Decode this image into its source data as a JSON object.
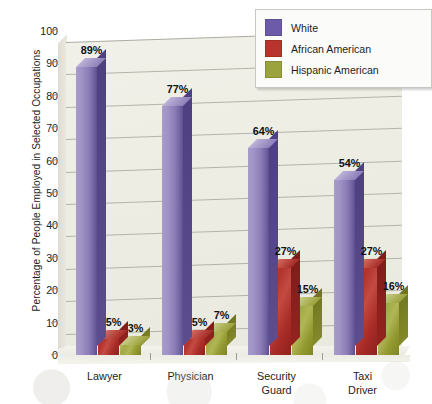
{
  "chart_data": {
    "type": "bar",
    "title": "",
    "subtitle": "",
    "xlabel": "",
    "ylabel": "Percentage of People Employed in Selected Occupations",
    "ylim": [
      0,
      100
    ],
    "ytick_values": [
      0,
      10,
      20,
      30,
      40,
      50,
      60,
      70,
      80,
      90,
      100
    ],
    "ytick_labels": [
      "0",
      "10",
      "20",
      "30",
      "40",
      "50",
      "60",
      "70",
      "80",
      "90",
      "100"
    ],
    "categories": [
      "Lawyer",
      "Physician",
      "Security Guard",
      "Taxi Driver"
    ],
    "category_lines": [
      [
        "Lawyer"
      ],
      [
        "Physician"
      ],
      [
        "Security",
        "Guard"
      ],
      [
        "Taxi",
        "Driver"
      ]
    ],
    "series": [
      {
        "name": "White",
        "color": "#6b5ba8",
        "values": [
          89,
          77,
          64,
          54
        ],
        "data_labels": [
          "89%",
          "77%",
          "64%",
          "54%"
        ]
      },
      {
        "name": "African American",
        "color": "#b8342e",
        "values": [
          5,
          5,
          27,
          27
        ],
        "data_labels": [
          "5%",
          "5%",
          "27%",
          "27%"
        ]
      },
      {
        "name": "Hispanic American",
        "color": "#9aa33c",
        "values": [
          3,
          7,
          15,
          16
        ],
        "data_labels": [
          "3%",
          "7%",
          "15%",
          "16%"
        ]
      }
    ],
    "grid": true,
    "grid_axis": "y",
    "legend_position": "top-right",
    "style": "3d-column",
    "value_suffix": "%"
  },
  "legend": {
    "entries": [
      {
        "label": "White",
        "color": "#6b5ba8"
      },
      {
        "label": "African American",
        "color": "#b8342e"
      },
      {
        "label": "Hispanic American",
        "color": "#9aa33c"
      }
    ]
  },
  "axes": {
    "y_title": "Percentage of People Employed in Selected Occupations",
    "y_ticks": [
      "100",
      "90",
      "80",
      "70",
      "60",
      "50",
      "40",
      "30",
      "20",
      "10",
      "0"
    ],
    "x_ticks": [
      "Lawyer",
      "Physician",
      "Security\nGuard",
      "Taxi\nDriver"
    ]
  },
  "colors": {
    "plot_background": "#eeede4",
    "page_background": "#ffffff",
    "gridline": "#a9aa9c",
    "axis": "#9d9c92",
    "text": "#1d1d1d"
  }
}
